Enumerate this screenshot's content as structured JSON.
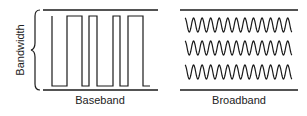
{
  "diagram": {
    "axis_label": "Bandwidth",
    "panels": [
      {
        "id": "baseband",
        "label": "Baseband",
        "signal": "square-wave (digital pulses)"
      },
      {
        "id": "broadband",
        "label": "Broadband",
        "signal": "three sine-wave carriers (analog channels)"
      }
    ],
    "colors": {
      "stroke": "#1a1a1a",
      "background": "#ffffff"
    }
  }
}
